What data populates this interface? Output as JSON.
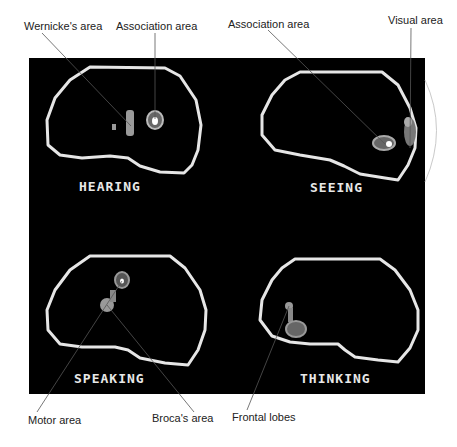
{
  "figure": {
    "type": "PET brain scan comparison",
    "panels": [
      {
        "id": "hearing",
        "label": "HEARING"
      },
      {
        "id": "seeing",
        "label": "SEEING"
      },
      {
        "id": "speaking",
        "label": "SPEAKING"
      },
      {
        "id": "thinking",
        "label": "THINKING"
      }
    ],
    "callouts": {
      "wernickes": "Wernicke's area",
      "association_1": "Association area",
      "association_2": "Association area",
      "visual": "Visual area",
      "motor": "Motor area",
      "brocas": "Broca's area",
      "frontal": "Frontal lobes"
    },
    "colors": {
      "panel_bg": "#000000",
      "outline": "#e6e6e6",
      "activity": "#9a9a9a",
      "leader_line": "#555555"
    }
  }
}
